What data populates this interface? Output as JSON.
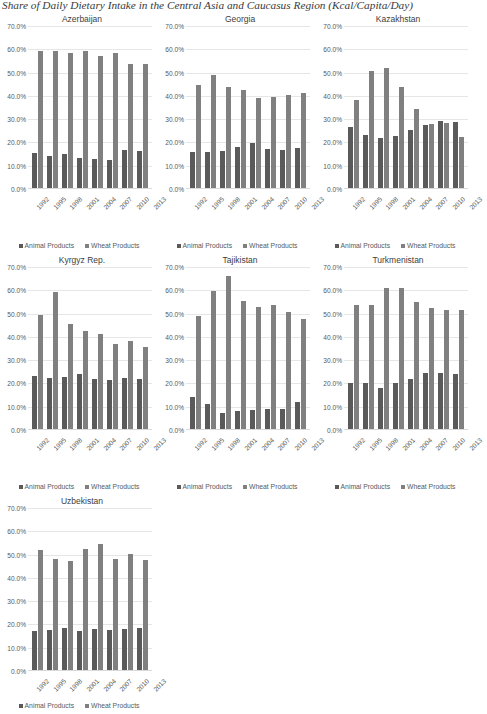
{
  "title": "Share of Daily Dietary Intake in the Central Asia and Caucasus Region (Kcal/Capita/Day)",
  "legend": {
    "animal": "Animal Products",
    "wheat": "Wheat Products"
  },
  "axis": {
    "yticks": [
      "70.0%",
      "60.0%",
      "50.0%",
      "40.0%",
      "30.0%",
      "20.0%",
      "10.0%",
      "0.0%"
    ],
    "ymin": 0,
    "ymax": 70
  },
  "chart_data": [
    {
      "type": "bar",
      "title": "Azerbaijan",
      "categories": [
        "1992",
        "1995",
        "1998",
        "2001",
        "2004",
        "2007",
        "2010",
        "2013"
      ],
      "series": [
        {
          "name": "Animal Products",
          "values": [
            15.2,
            13.8,
            14.4,
            12.9,
            12.5,
            12.2,
            16.4,
            16.1
          ]
        },
        {
          "name": "Wheat Products",
          "values": [
            59.0,
            58.7,
            57.9,
            58.9,
            56.5,
            57.8,
            53.3,
            53.1
          ]
        }
      ],
      "xlabel": "",
      "ylabel": "",
      "ylim": [
        0,
        70
      ],
      "grid": true,
      "legend_position": "bottom"
    },
    {
      "type": "bar",
      "title": "Georgia",
      "categories": [
        "1992",
        "1995",
        "1998",
        "2001",
        "2004",
        "2007",
        "2010",
        "2013"
      ],
      "series": [
        {
          "name": "Animal Products",
          "values": [
            15.3,
            15.3,
            16.0,
            17.5,
            19.4,
            16.9,
            16.4,
            17.2
          ]
        },
        {
          "name": "Wheat Products",
          "values": [
            44.1,
            48.4,
            43.4,
            42.2,
            38.7,
            38.9,
            39.9,
            41.0
          ]
        }
      ],
      "xlabel": "",
      "ylabel": "",
      "ylim": [
        0,
        70
      ],
      "grid": true,
      "legend_position": "bottom"
    },
    {
      "type": "bar",
      "title": "Kazakhstan",
      "categories": [
        "1992",
        "1995",
        "1998",
        "2001",
        "2004",
        "2007",
        "2010",
        "2013"
      ],
      "series": [
        {
          "name": "Animal Products",
          "values": [
            26.1,
            22.8,
            21.4,
            22.2,
            24.9,
            27.2,
            28.6,
            28.4
          ]
        },
        {
          "name": "Wheat Products",
          "values": [
            37.7,
            50.2,
            51.4,
            43.2,
            34.1,
            27.5,
            28.1,
            21.7
          ]
        }
      ],
      "xlabel": "",
      "ylabel": "",
      "ylim": [
        0,
        70
      ],
      "grid": true,
      "legend_position": "bottom"
    },
    {
      "type": "bar",
      "title": "Kyrgyz Rep.",
      "categories": [
        "1992",
        "1995",
        "1998",
        "2001",
        "2004",
        "2007",
        "2010",
        "2013"
      ],
      "series": [
        {
          "name": "Animal Products",
          "values": [
            22.6,
            22.1,
            22.4,
            23.8,
            21.3,
            21.0,
            21.8,
            21.5
          ]
        },
        {
          "name": "Wheat Products",
          "values": [
            48.9,
            58.8,
            45.3,
            42.2,
            40.6,
            36.4,
            37.6,
            35.2
          ]
        }
      ],
      "xlabel": "",
      "ylabel": "",
      "ylim": [
        0,
        70
      ],
      "grid": true,
      "legend_position": "bottom"
    },
    {
      "type": "bar",
      "title": "Tajikistan",
      "categories": [
        "1992",
        "1995",
        "1998",
        "2001",
        "2004",
        "2007",
        "2010",
        "2013"
      ],
      "series": [
        {
          "name": "Animal Products",
          "values": [
            13.6,
            10.8,
            6.8,
            7.7,
            8.0,
            8.6,
            8.8,
            11.8
          ]
        },
        {
          "name": "Wheat Products",
          "values": [
            48.4,
            59.1,
            65.5,
            55.0,
            52.6,
            53.4,
            50.4,
            47.2
          ]
        }
      ],
      "xlabel": "",
      "ylabel": "",
      "ylim": [
        0,
        70
      ],
      "grid": true,
      "legend_position": "bottom"
    },
    {
      "type": "bar",
      "title": "Turkmenistan",
      "categories": [
        "1992",
        "1995",
        "1998",
        "2001",
        "2004",
        "2007",
        "2010",
        "2013"
      ],
      "series": [
        {
          "name": "Animal Products",
          "values": [
            19.9,
            19.9,
            17.4,
            19.7,
            21.5,
            24.2,
            24.0,
            23.8
          ]
        },
        {
          "name": "Wheat Products",
          "values": [
            53.1,
            53.2,
            60.4,
            60.5,
            54.4,
            52.1,
            51.0,
            51.3
          ]
        }
      ],
      "xlabel": "",
      "ylabel": "",
      "ylim": [
        0,
        70
      ],
      "grid": true,
      "legend_position": "bottom"
    },
    {
      "type": "bar",
      "title": "Uzbekistan",
      "categories": [
        "1992",
        "1995",
        "1998",
        "2001",
        "2004",
        "2007",
        "2010",
        "2013"
      ],
      "series": [
        {
          "name": "Animal Products",
          "values": [
            16.7,
            17.3,
            17.9,
            16.8,
            17.4,
            17.2,
            17.6,
            18.2
          ]
        },
        {
          "name": "Wheat Products",
          "values": [
            51.4,
            47.5,
            46.9,
            52.0,
            54.3,
            47.8,
            49.7,
            47.3
          ]
        }
      ],
      "xlabel": "",
      "ylabel": "",
      "ylim": [
        0,
        70
      ],
      "grid": true,
      "legend_position": "bottom"
    }
  ]
}
